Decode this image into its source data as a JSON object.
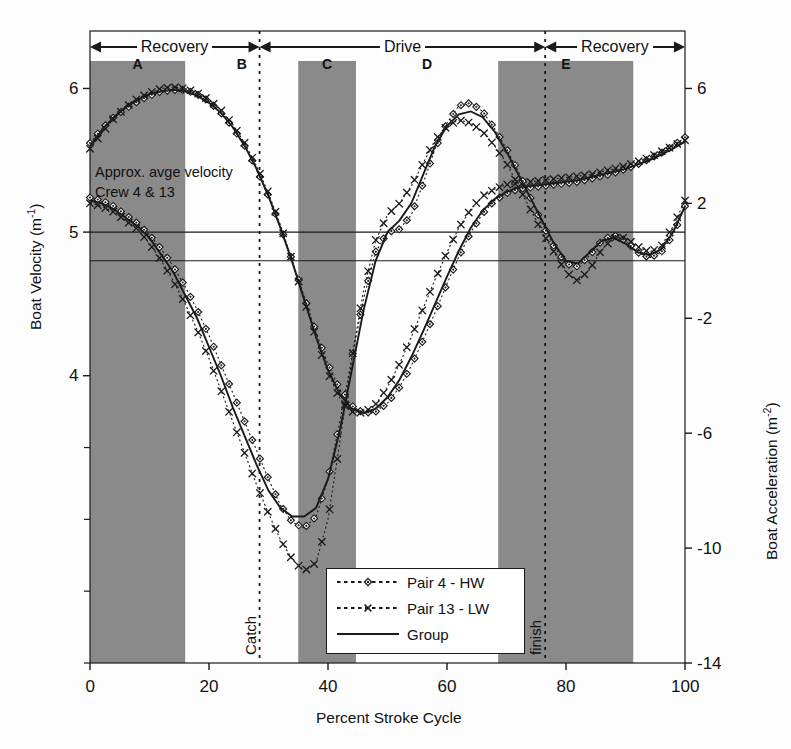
{
  "figure": {
    "background": "#ffffff",
    "band_color": "#8a8a8a",
    "line_color": "#1a1a1a"
  },
  "axes": {
    "x": {
      "label": "Percent Stroke Cycle",
      "ticks": [
        "0",
        "20",
        "40",
        "60",
        "80",
        "100"
      ],
      "tick_values": [
        0,
        20,
        40,
        60,
        80,
        100
      ],
      "min": 0,
      "max": 100
    },
    "y_left": {
      "label_main": "Boat Velocity (m",
      "label_sup": "-1",
      "label_close": ")",
      "ticks": [
        "6",
        "5",
        "4"
      ],
      "tick_values": [
        6,
        5,
        4
      ],
      "min": 2.0,
      "max": 6.4
    },
    "y_right": {
      "label_main": "Boat Acceleration (m",
      "label_sup": "-2",
      "label_close": ")",
      "ticks": [
        "6",
        "2",
        "-2",
        "-6",
        "-10",
        "-14"
      ],
      "tick_values": [
        6,
        2,
        -2,
        -6,
        -10,
        -14
      ],
      "min": -14,
      "max": 8
    }
  },
  "phases": [
    {
      "name": "Recovery",
      "start": 0,
      "end": 28.5
    },
    {
      "name": "Drive",
      "start": 28.5,
      "end": 76.5
    },
    {
      "name": "Recovery",
      "start": 76.5,
      "end": 100
    }
  ],
  "bands": [
    {
      "letter": "A",
      "start": 0,
      "end": 16.0
    },
    {
      "letter": "B",
      "start": 16.0,
      "end": 35.0,
      "shaded": false
    },
    {
      "letter": "C",
      "start": 35.0,
      "end": 44.7
    },
    {
      "letter": "D",
      "start": 44.7,
      "end": 68.6,
      "shaded": false
    },
    {
      "letter": "E",
      "start": 68.6,
      "end": 91.3
    }
  ],
  "markers": [
    {
      "label": "Catch",
      "x": 28.5
    },
    {
      "label": "finish",
      "x": 76.5
    }
  ],
  "annotations": {
    "avg_velocity_line1": "Approx. avge velocity",
    "avg_velocity_line2": "Crew 4 & 13",
    "avg_velocity_value": 5.0,
    "zero_acceleration_value": 0
  },
  "legend": {
    "position": "bottom-center",
    "entries": [
      {
        "label": "Pair 4 - HW",
        "style": "dotted",
        "marker": "diamond"
      },
      {
        "label": "Pair 13 - LW",
        "style": "dotted",
        "marker": "cross"
      },
      {
        "label": "Group",
        "style": "solid",
        "marker": "none"
      }
    ]
  },
  "chart_data": {
    "type": "line",
    "title": "",
    "xlabel": "Percent Stroke Cycle",
    "ylabel": "Boat Velocity (m-1)",
    "ylabel_right": "Boat Acceleration (m-2)",
    "xlim": [
      0,
      100
    ],
    "ylim": [
      2.0,
      6.4
    ],
    "ylim_right": [
      -14,
      8
    ],
    "grid": false,
    "legend_position": "bottom-center",
    "x": [
      0,
      2,
      4,
      6,
      8,
      10,
      12,
      14,
      16,
      18,
      20,
      22,
      24,
      26,
      28,
      30,
      32,
      34,
      36,
      38,
      40,
      42,
      44,
      46,
      48,
      50,
      52,
      54,
      56,
      58,
      60,
      62,
      64,
      66,
      68,
      70,
      72,
      74,
      76,
      78,
      80,
      82,
      84,
      86,
      88,
      90,
      92,
      94,
      96,
      98,
      100
    ],
    "panels": [
      {
        "name": "Boat Velocity",
        "units": "m s-1",
        "axis": "left",
        "series": [
          {
            "name": "Pair 4 - HW",
            "values": [
              5.62,
              5.72,
              5.8,
              5.86,
              5.91,
              5.95,
              5.98,
              5.99,
              5.99,
              5.96,
              5.91,
              5.83,
              5.73,
              5.6,
              5.44,
              5.25,
              5.04,
              4.8,
              4.55,
              4.3,
              4.08,
              3.9,
              3.79,
              3.74,
              3.75,
              3.81,
              3.92,
              4.07,
              4.25,
              4.44,
              4.64,
              4.83,
              5.0,
              5.13,
              5.22,
              5.27,
              5.3,
              5.31,
              5.32,
              5.33,
              5.34,
              5.35,
              5.37,
              5.39,
              5.41,
              5.44,
              5.47,
              5.51,
              5.55,
              5.6,
              5.66
            ]
          },
          {
            "name": "Pair 13 - LW",
            "values": [
              5.58,
              5.69,
              5.79,
              5.87,
              5.93,
              5.97,
              6.0,
              6.01,
              6.0,
              5.97,
              5.92,
              5.85,
              5.75,
              5.62,
              5.46,
              5.27,
              5.05,
              4.8,
              4.53,
              4.26,
              4.02,
              3.84,
              3.75,
              3.74,
              3.8,
              3.92,
              4.08,
              4.27,
              4.47,
              4.67,
              4.86,
              5.03,
              5.16,
              5.25,
              5.3,
              5.33,
              5.34,
              5.35,
              5.36,
              5.37,
              5.38,
              5.39,
              5.4,
              5.42,
              5.44,
              5.46,
              5.49,
              5.52,
              5.56,
              5.6,
              5.64
            ]
          },
          {
            "name": "Group",
            "values": [
              5.6,
              5.71,
              5.8,
              5.87,
              5.92,
              5.96,
              5.98,
              5.99,
              5.98,
              5.95,
              5.9,
              5.83,
              5.73,
              5.6,
              5.44,
              5.25,
              5.03,
              4.79,
              4.53,
              4.27,
              4.04,
              3.87,
              3.77,
              3.74,
              3.77,
              3.85,
              3.97,
              4.13,
              4.31,
              4.5,
              4.69,
              4.87,
              5.03,
              5.15,
              5.23,
              5.28,
              5.31,
              5.32,
              5.33,
              5.34,
              5.35,
              5.36,
              5.38,
              5.4,
              5.42,
              5.44,
              5.47,
              5.5,
              5.54,
              5.58,
              5.63
            ]
          }
        ]
      },
      {
        "name": "Boat Acceleration",
        "units": "m s-2",
        "axis": "right",
        "series": [
          {
            "name": "Pair 4 - HW",
            "values": [
              2.2,
              2.1,
              1.9,
              1.6,
              1.3,
              0.9,
              0.4,
              -0.2,
              -0.9,
              -1.7,
              -2.6,
              -3.6,
              -4.6,
              -5.6,
              -6.6,
              -7.6,
              -8.5,
              -9.1,
              -9.3,
              -8.9,
              -7.6,
              -5.6,
              -3.4,
              -1.3,
              0.3,
              1.0,
              1.1,
              1.6,
              2.7,
              3.9,
              4.8,
              5.4,
              5.5,
              5.2,
              4.6,
              3.9,
              3.1,
              2.2,
              1.3,
              0.5,
              -0.1,
              -0.2,
              0.2,
              0.7,
              0.9,
              0.7,
              0.3,
              0.1,
              0.3,
              0.9,
              1.9
            ]
          },
          {
            "name": "Pair 13 - LW",
            "values": [
              2.0,
              1.9,
              1.7,
              1.4,
              1.1,
              0.6,
              0.0,
              -0.7,
              -1.5,
              -2.4,
              -3.4,
              -4.5,
              -5.6,
              -6.7,
              -7.8,
              -8.8,
              -9.7,
              -10.4,
              -10.8,
              -10.5,
              -9.0,
              -6.3,
              -3.4,
              -1.0,
              0.7,
              1.6,
              2.0,
              2.6,
              3.4,
              4.2,
              4.7,
              4.9,
              4.8,
              4.5,
              4.0,
              3.4,
              2.6,
              1.8,
              1.0,
              0.3,
              -0.4,
              -0.7,
              -0.3,
              0.4,
              0.8,
              0.8,
              0.5,
              0.3,
              0.5,
              1.2,
              2.1
            ]
          },
          {
            "name": "Group",
            "values": [
              2.1,
              2.0,
              1.8,
              1.5,
              1.2,
              0.8,
              0.2,
              -0.4,
              -1.2,
              -2.0,
              -3.0,
              -4.0,
              -5.1,
              -6.1,
              -7.1,
              -8.0,
              -8.6,
              -8.9,
              -8.9,
              -8.6,
              -7.6,
              -5.9,
              -3.8,
              -1.7,
              0.0,
              1.0,
              1.4,
              2.0,
              3.0,
              4.0,
              4.7,
              5.1,
              5.2,
              5.0,
              4.5,
              3.8,
              3.0,
              2.2,
              1.4,
              0.6,
              0.0,
              -0.1,
              0.3,
              0.7,
              0.8,
              0.6,
              0.3,
              0.2,
              0.4,
              1.0,
              1.9
            ]
          }
        ]
      }
    ]
  }
}
